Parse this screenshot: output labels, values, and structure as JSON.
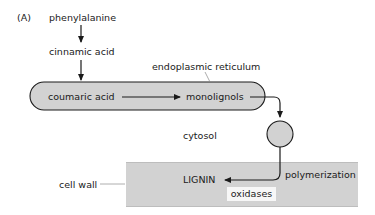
{
  "figure": {
    "panel_label": "(A)",
    "nodes": {
      "phenylalanine": "phenylalanine",
      "cinnamic_acid": "cinnamic acid",
      "coumaric_acid": "coumaric acid",
      "monolignols": "monolignols",
      "lignin": "LIGNIN"
    },
    "compartments": {
      "er": "endoplasmic reticulum",
      "cytosol": "cytosol",
      "cell_wall": "cell wall"
    },
    "annotations": {
      "polymerization": "polymerization",
      "oxidases": "oxidases"
    },
    "colors": {
      "er_fill": "#d2d2d2",
      "vesicle_fill": "#d2d2d2",
      "wall_fill": "#d2d2d2",
      "stroke": "#1a1a1a",
      "oxidases_box": "#f7f7f7"
    }
  }
}
